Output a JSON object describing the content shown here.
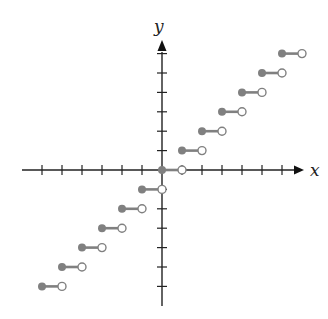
{
  "chart_data": {
    "type": "step",
    "title": "",
    "function": "greatest integer function y = floor(x)",
    "xlabel": "x",
    "ylabel": "y",
    "xlim": [
      -7,
      7
    ],
    "ylim": [
      -7,
      7
    ],
    "grid": false,
    "tick_interval": 1,
    "steps": [
      {
        "x_start": -6,
        "x_end": -5,
        "y": -6
      },
      {
        "x_start": -5,
        "x_end": -4,
        "y": -5
      },
      {
        "x_start": -4,
        "x_end": -3,
        "y": -4
      },
      {
        "x_start": -3,
        "x_end": -2,
        "y": -3
      },
      {
        "x_start": -2,
        "x_end": -1,
        "y": -2
      },
      {
        "x_start": -1,
        "x_end": 0,
        "y": -1
      },
      {
        "x_start": 0,
        "x_end": 1,
        "y": 0
      },
      {
        "x_start": 1,
        "x_end": 2,
        "y": 1
      },
      {
        "x_start": 2,
        "x_end": 3,
        "y": 2
      },
      {
        "x_start": 3,
        "x_end": 4,
        "y": 3
      },
      {
        "x_start": 4,
        "x_end": 5,
        "y": 4
      },
      {
        "x_start": 5,
        "x_end": 6,
        "y": 5
      },
      {
        "x_start": 6,
        "x_end": 7,
        "y": 6
      }
    ],
    "closed_endpoint": "left",
    "open_endpoint": "right",
    "colors": {
      "axis": "#222222",
      "step": "#808080",
      "open_fill": "#ffffff"
    }
  }
}
